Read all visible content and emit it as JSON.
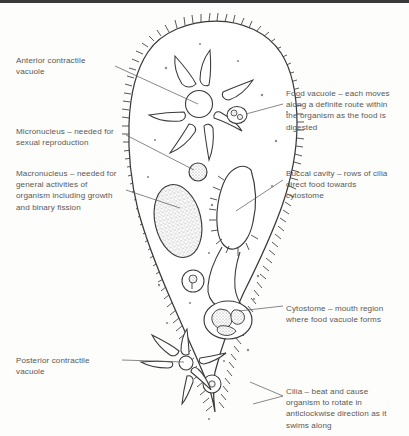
{
  "figure": {
    "line_color": "#3a3a3a",
    "text_color": "#585858",
    "background": "#fdfdfc"
  },
  "labels": {
    "anterior_contractile_vacuole": "Anterior contractile\nvacuole",
    "micronucleus": "Micronucleus – needed for\nsexual reproduction",
    "macronucleus": "Macronucleus – needed for\ngeneral activities of\norganism including growth\nand binary fission",
    "posterior_contractile_vacuole": "Posterior contractile\nvacuole",
    "food_vacuole": "Food vacuole – each moves\nalong a definite route within\nthe organism as the food is\ndigested",
    "buccal_cavity": "Buccal cavity – rows of cilia\ndirect food towards\ncytostome",
    "cytostome": "Cytostome – mouth region\nwhere food vacuole forms",
    "cilia": "Cilia – beat and cause\norganism to rotate in\nanticlockwise direction as it\nswims along"
  },
  "structures": {
    "cell_membrane": "cell-outline",
    "anterior_vacuole": "star-shaped contractile vacuole with radiating canals",
    "posterior_vacuole": "star-shaped contractile vacuole with radiating canals",
    "macronucleus": "large stippled oval nucleus",
    "micronucleus": "small round nucleus",
    "buccal_cavity": "elongated ciliated oral groove",
    "cytostome": "rounded mouth region containing food particles",
    "food_vacuoles": "small circles containing granules",
    "cilia": "short hair-like projections around cell margin"
  }
}
